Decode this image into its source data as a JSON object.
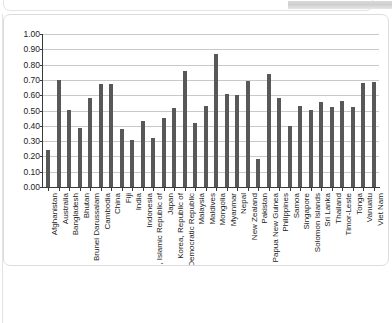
{
  "window": {
    "top_panel_name": "top-rounded-panel",
    "gray_band_name": "top-gray-band"
  },
  "chart_data": {
    "type": "bar",
    "title": "",
    "subtitle": "",
    "xlabel": "",
    "ylabel": "",
    "ylim": [
      0.0,
      1.0
    ],
    "ytick_step": 0.1,
    "grid": true,
    "legend": "none",
    "bar_color": "#585858",
    "gridline_color": "#c9c9c9",
    "axis_color": "#3a3a3a",
    "ytick_labels": [
      "1.00",
      "0.90",
      "0.80",
      "0.70",
      "0.60",
      "0.50",
      "0.40",
      "0.30",
      "0.20",
      "0.10",
      "0.00"
    ],
    "categories": [
      "Afghanistan",
      "Australia",
      "Bangladesh",
      "Bhutan",
      "Brunei Darussalam",
      "Cambodia",
      "China",
      "Fiji",
      "India",
      "Indonesia",
      "Iran, Islamic Republic of",
      "Japan",
      "Korea, Republic of",
      "Lao People's Democratic Republic",
      "Malaysia",
      "Maldives",
      "Mongolia",
      "Myanmar",
      "Nepal",
      "New Zealand",
      "Pakistan",
      "Papua New Guinea",
      "Philippines",
      "Samoa",
      "Singapore",
      "Solomon Islands",
      "Sri Lanka",
      "Thailand",
      "Timor-Leste",
      "Tonga",
      "Vanuatu",
      "Viet Nam"
    ],
    "values": [
      0.24,
      0.7,
      0.505,
      0.385,
      0.585,
      0.675,
      0.675,
      0.38,
      0.31,
      0.43,
      0.32,
      0.45,
      0.515,
      0.76,
      0.42,
      0.53,
      0.87,
      0.61,
      0.6,
      0.69,
      0.18,
      0.74,
      0.58,
      0.4,
      0.53,
      0.505,
      0.555,
      0.52,
      0.565,
      0.525,
      0.68,
      0.685
    ]
  }
}
